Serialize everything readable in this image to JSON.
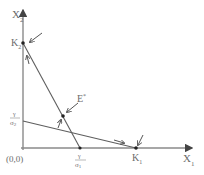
{
  "diagram": {
    "title": "",
    "axes": {
      "x_label": "X",
      "x_sub": "1",
      "y_label": "X",
      "y_sub": "2",
      "origin_label": "(0,0)"
    },
    "points": {
      "k1": {
        "label": "K",
        "sub": "1"
      },
      "k2": {
        "label": "K",
        "sub": "2"
      },
      "equilibrium": {
        "label": "E",
        "sup": "*"
      }
    },
    "intercepts": {
      "x_intercept": {
        "numerator": "γ",
        "denominator": "σ",
        "sub": "1"
      },
      "y_intercept": {
        "numerator": "γ",
        "denominator": "σ",
        "sub": "2"
      }
    },
    "lines": [
      {
        "name": "isocline-1",
        "from": "K2",
        "to": "x_intercept"
      },
      {
        "name": "isocline-2",
        "from": "y_intercept",
        "to": "K1"
      }
    ],
    "colors": {
      "axis": "#8a8a8a",
      "line": "#5e5e5e",
      "text": "#6b6b6b"
    }
  }
}
